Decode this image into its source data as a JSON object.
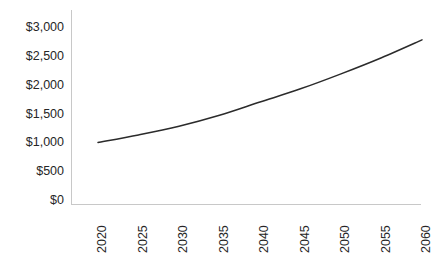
{
  "chart_data": {
    "type": "line",
    "title": "",
    "subtitle": "",
    "xlabel": "",
    "ylabel": "",
    "x": [
      2020,
      2025,
      2030,
      2035,
      2040,
      2045,
      2050,
      2055,
      2060
    ],
    "xtick_labels": [
      "2020",
      "2025",
      "2030",
      "2035",
      "2040",
      "2045",
      "2050",
      "2055",
      "2060"
    ],
    "xlim": [
      2020,
      2060
    ],
    "ytick_values": [
      0,
      500,
      1000,
      1500,
      2000,
      2500,
      3000
    ],
    "ytick_labels": [
      "$0",
      "$500",
      "$1,000",
      "$1,500",
      "$2,000",
      "$2,500",
      "$3,000"
    ],
    "ylim": [
      0,
      3000
    ],
    "grid": false,
    "legend": false,
    "legend_position": "none",
    "series": [
      {
        "name": "Projection",
        "color": "#2b2b2b",
        "line_width": 1.5,
        "markers": false,
        "values": [
          1000,
          1130,
          1280,
          1470,
          1700,
          1930,
          2190,
          2470,
          2780
        ]
      }
    ],
    "axis_color": "#c8c8c8",
    "background_color": "#ffffff",
    "xtick_label_rotation": -90,
    "annotations": []
  },
  "layout": {
    "plot_left": 71,
    "plot_right": 421,
    "plot_top": 10,
    "plot_bottom": 204,
    "x_first_tick": 98,
    "x_tick_spacing": 40.5,
    "y_zero": 200,
    "y_per_500": 28.8
  }
}
